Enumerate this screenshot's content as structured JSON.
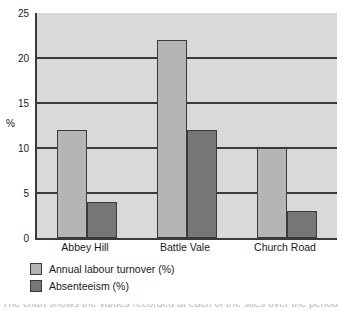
{
  "chart_data": {
    "type": "bar",
    "title": "",
    "xlabel": "",
    "ylabel": "%",
    "categories": [
      "Abbey Hill",
      "Battle Vale",
      "Church Road"
    ],
    "series": [
      {
        "name": "Annual labour turnover (%)",
        "values": [
          12,
          22,
          10
        ],
        "color": "#b5b5b5"
      },
      {
        "name": "Absenteeism (%)",
        "values": [
          4,
          12,
          3
        ],
        "color": "#767676"
      }
    ],
    "ylim": [
      0,
      25
    ],
    "yticks": [
      0,
      5,
      10,
      15,
      20,
      25
    ],
    "ytick_labels": [
      "0",
      "5",
      "10",
      "15",
      "20",
      "25"
    ],
    "grid": true,
    "grid_axis": "y",
    "legend_position": "below-left",
    "plot_background": "#d9d9d9",
    "axis_color": "#3a3a3a"
  },
  "legend": {
    "entries": [
      {
        "label": "Annual labour turnover (%)",
        "swatch": "s1"
      },
      {
        "label": "Absenteeism (%)",
        "swatch": "s2"
      }
    ]
  },
  "footer": {
    "cutoff_text": "The chart shows the values recorded at each of the sites over the period"
  }
}
